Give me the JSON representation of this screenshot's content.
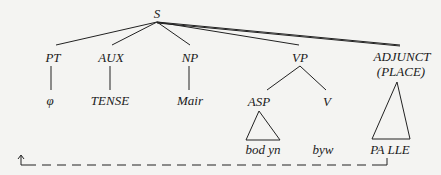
{
  "diagram": {
    "type": "syntax-tree",
    "root": {
      "label": "S"
    },
    "nodes": {
      "pt": "PT",
      "aux": "AUX",
      "np": "NP",
      "vp": "VP",
      "adjunct": "ADJUNCT",
      "adjunct_sub": "(PLACE)",
      "asp": "ASP",
      "v": "V"
    },
    "leaves": {
      "pt": "φ",
      "aux": "TENSE",
      "np": "Mair",
      "asp": "bod yn",
      "v": "byw",
      "adjunct": "PA LLE"
    },
    "movement_arrow": {
      "from": "PA LLE",
      "to": "sentence-initial position",
      "style": "dashed"
    }
  }
}
